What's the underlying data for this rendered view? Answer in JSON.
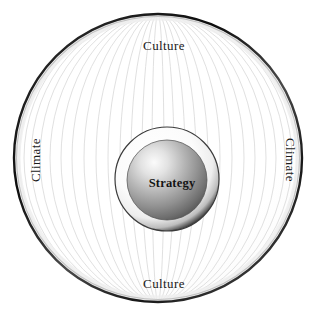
{
  "diagram": {
    "type": "concentric-circles",
    "background_color": "#ffffff",
    "outer_sphere": {
      "label_top": "Culture",
      "label_bottom": "Culture",
      "label_left": "Climate",
      "label_right": "Climate",
      "rim_color": "#111111",
      "fill_color": "#ffffff",
      "meridian_color": "#d9d9d9",
      "center_x": 158,
      "center_y": 158,
      "radius": 145
    },
    "inner_sphere": {
      "label": "Strategy",
      "halo_color": "#f2f2f2",
      "halo_edge_color": "#3a3a3a",
      "fill_highlight": "#f4f4f4",
      "fill_mid": "#a8a8a8",
      "fill_edge": "#5e5e5e",
      "center_x": 167,
      "center_y": 183,
      "radius": 40,
      "ring_radius": 52
    },
    "text_color": "#1a1a1a",
    "labels": [
      {
        "name": "culture-top",
        "text": "Culture",
        "position": "top",
        "rotation": 0
      },
      {
        "name": "climate-right",
        "text": "Climate",
        "position": "right",
        "rotation": 90
      },
      {
        "name": "culture-bottom",
        "text": "Culture",
        "position": "bottom",
        "rotation": 0
      },
      {
        "name": "climate-left",
        "text": "Climate",
        "position": "left",
        "rotation": -90
      },
      {
        "name": "strategy-center",
        "text": "Strategy",
        "position": "center",
        "rotation": 0
      }
    ]
  }
}
